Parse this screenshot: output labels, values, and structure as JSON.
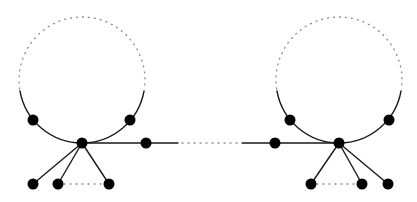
{
  "diagram": {
    "type": "graph",
    "colors": {
      "edge": "#1a1a1a",
      "vertex": "#000000",
      "dotted": "#8a8a8a",
      "background": "#ffffff"
    },
    "components": [
      {
        "id": "left",
        "circle": {
          "cx": 82,
          "cy": 80,
          "r": 63
        },
        "hub": {
          "x": 82,
          "y": 143
        },
        "cycle_vertices": [
          {
            "x": 33,
            "y": 120
          },
          {
            "x": 130,
            "y": 120
          }
        ],
        "path_vertex": {
          "x": 146,
          "y": 143
        },
        "leaves": [
          {
            "x": 33,
            "y": 184
          },
          {
            "x": 58,
            "y": 184
          },
          {
            "x": 109,
            "y": 184
          }
        ],
        "dotted_leaf_span": [
          58,
          109
        ]
      },
      {
        "id": "right",
        "circle": {
          "cx": 339,
          "cy": 80,
          "r": 63
        },
        "hub": {
          "x": 339,
          "y": 143
        },
        "cycle_vertices": [
          {
            "x": 290,
            "y": 120
          },
          {
            "x": 389,
            "y": 120
          }
        ],
        "path_vertex": {
          "x": 275,
          "y": 143
        },
        "leaves": [
          {
            "x": 311,
            "y": 184
          },
          {
            "x": 362,
            "y": 184
          },
          {
            "x": 388,
            "y": 184
          }
        ],
        "dotted_leaf_span": [
          311,
          362
        ]
      }
    ],
    "connector": {
      "solid_left_end": 178,
      "solid_right_start": 242,
      "y": 143
    }
  }
}
